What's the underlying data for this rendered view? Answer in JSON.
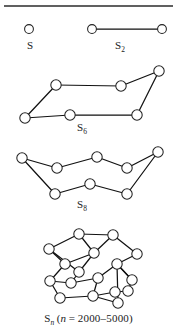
{
  "figure": {
    "background_color": "#ffffff",
    "node_fill": "#ffffff",
    "node_stroke": "#222222",
    "edge_color": "#111111",
    "rule_color": "#2b2b2b",
    "rule": {
      "x1": 4,
      "y1": 6,
      "x2": 173,
      "y2": 6
    }
  },
  "captions": {
    "s": {
      "base": "S",
      "sub": ""
    },
    "s2": {
      "base": "S",
      "sub": "2"
    },
    "s6": {
      "base": "S",
      "sub": "6"
    },
    "s8": {
      "base": "S",
      "sub": "8"
    },
    "sn": {
      "base": "S",
      "sub": "n",
      "paren_open": "(",
      "var": "n",
      "equals": " = ",
      "range": "2000–5000",
      "paren_close": ")"
    }
  },
  "structures": [
    {
      "id": "s",
      "label": "S",
      "atom_count": 1,
      "node_radius": 4.4,
      "nodes": [
        {
          "x": 29,
          "y": 29
        }
      ],
      "edges": []
    },
    {
      "id": "s2",
      "label": "S2",
      "atom_count": 2,
      "node_radius": 4.4,
      "nodes": [
        {
          "x": 92,
          "y": 29
        },
        {
          "x": 162,
          "y": 29
        }
      ],
      "edges": [
        [
          0,
          1
        ]
      ]
    },
    {
      "id": "s6",
      "label": "S6",
      "atom_count": 6,
      "node_radius": 5.2,
      "nodes": [
        {
          "x": 25,
          "y": 118
        },
        {
          "x": 56,
          "y": 85
        },
        {
          "x": 121,
          "y": 86
        },
        {
          "x": 159,
          "y": 71
        },
        {
          "x": 137,
          "y": 115
        },
        {
          "x": 70,
          "y": 115
        }
      ],
      "edges": [
        [
          0,
          1
        ],
        [
          1,
          2
        ],
        [
          2,
          3
        ],
        [
          3,
          4
        ],
        [
          4,
          5
        ],
        [
          5,
          0
        ]
      ]
    },
    {
      "id": "s8",
      "label": "S8",
      "atom_count": 8,
      "node_radius": 5.2,
      "nodes": [
        {
          "x": 22,
          "y": 158
        },
        {
          "x": 57,
          "y": 168
        },
        {
          "x": 97,
          "y": 157
        },
        {
          "x": 127,
          "y": 168
        },
        {
          "x": 158,
          "y": 152
        },
        {
          "x": 127,
          "y": 194
        },
        {
          "x": 90,
          "y": 184
        },
        {
          "x": 55,
          "y": 194
        }
      ],
      "edges": [
        [
          0,
          1
        ],
        [
          1,
          2
        ],
        [
          2,
          3
        ],
        [
          3,
          4
        ],
        [
          4,
          5
        ],
        [
          5,
          6
        ],
        [
          6,
          7
        ],
        [
          7,
          0
        ]
      ]
    },
    {
      "id": "sn",
      "label": "Sn",
      "atom_count": 20,
      "node_radius": 5.2,
      "nodes": [
        {
          "x": 79,
          "y": 234
        },
        {
          "x": 113,
          "y": 235
        },
        {
          "x": 49,
          "y": 249
        },
        {
          "x": 137,
          "y": 254
        },
        {
          "x": 65,
          "y": 264
        },
        {
          "x": 94,
          "y": 253
        },
        {
          "x": 117,
          "y": 264
        },
        {
          "x": 79,
          "y": 272
        },
        {
          "x": 132,
          "y": 280
        },
        {
          "x": 50,
          "y": 281
        },
        {
          "x": 71,
          "y": 283
        },
        {
          "x": 98,
          "y": 278
        },
        {
          "x": 128,
          "y": 291
        },
        {
          "x": 60,
          "y": 298
        },
        {
          "x": 93,
          "y": 296
        },
        {
          "x": 115,
          "y": 292
        },
        {
          "x": 118,
          "y": 303
        }
      ],
      "edges": [
        [
          0,
          1
        ],
        [
          0,
          2
        ],
        [
          1,
          3
        ],
        [
          2,
          4
        ],
        [
          3,
          6
        ],
        [
          4,
          5
        ],
        [
          5,
          1
        ],
        [
          4,
          9
        ],
        [
          6,
          8
        ],
        [
          7,
          5
        ],
        [
          7,
          10
        ],
        [
          9,
          13
        ],
        [
          10,
          11
        ],
        [
          11,
          14
        ],
        [
          14,
          15
        ],
        [
          15,
          12
        ],
        [
          12,
          8
        ],
        [
          8,
          6
        ],
        [
          6,
          16
        ],
        [
          2,
          7
        ],
        [
          11,
          6
        ],
        [
          9,
          10
        ],
        [
          14,
          16
        ],
        [
          13,
          14
        ],
        [
          0,
          5
        ]
      ]
    }
  ]
}
